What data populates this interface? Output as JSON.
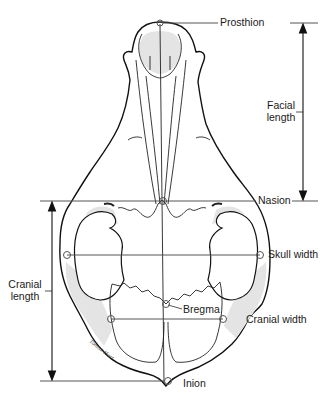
{
  "diagram": {
    "colors": {
      "outline": "#111111",
      "fill": "#ffffff",
      "shade": "#e4e4e4",
      "measure_line": "#555555",
      "text": "#1a1a1a"
    },
    "landmarks": [
      {
        "id": "prosthion",
        "label": "Prosthion",
        "x": 160,
        "y": 23
      },
      {
        "id": "nasion",
        "label": "Nasion",
        "x": 164,
        "y": 201
      },
      {
        "id": "skull-width-left",
        "label": "",
        "x": 67,
        "y": 255
      },
      {
        "id": "skull-width-right",
        "label": "Skull width",
        "x": 260,
        "y": 255
      },
      {
        "id": "bregma",
        "label": "Bregma",
        "x": 166,
        "y": 304
      },
      {
        "id": "cranial-width-left",
        "label": "",
        "x": 111,
        "y": 319
      },
      {
        "id": "cranial-width-right",
        "label": "Cranial width",
        "x": 223,
        "y": 319
      },
      {
        "id": "inion",
        "label": "Inion",
        "x": 168,
        "y": 381
      }
    ],
    "measurements": [
      {
        "id": "facial-length",
        "label_line1": "Facial",
        "label_line2": "length",
        "from": "Prosthion",
        "to": "Nasion"
      },
      {
        "id": "cranial-length",
        "label_line1": "Cranial",
        "label_line2": "length",
        "from": "Nasion",
        "to": "Inion"
      },
      {
        "id": "skull-width",
        "label": "Skull width"
      },
      {
        "id": "cranial-width",
        "label": "Cranial width"
      }
    ],
    "labels": {
      "prosthion": "Prosthion",
      "facial_length_1": "Facial",
      "facial_length_2": "length",
      "nasion": "Nasion",
      "skull_width": "Skull width",
      "cranial_length_1": "Cranial",
      "cranial_length_2": "length",
      "bregma": "Bregma",
      "cranial_width": "Cranial width",
      "inion": "Inion"
    },
    "signature": "Tomas Hart"
  }
}
